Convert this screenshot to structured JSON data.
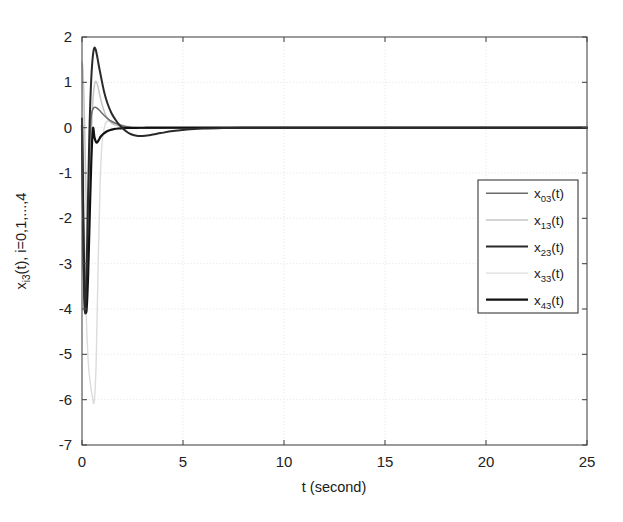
{
  "chart_data": {
    "type": "line",
    "title": "",
    "xlabel": "t (second)",
    "ylabel": "x_i3(t), i=0,1,...,4",
    "ylabel_parts": {
      "base": "x",
      "sub": "i3",
      "tail": "(t), i=0,1,...,4"
    },
    "xlim": [
      0,
      25
    ],
    "ylim": [
      -7,
      2
    ],
    "xticks": [
      0,
      5,
      10,
      15,
      20,
      25
    ],
    "xticklabels": [
      "0",
      "5",
      "10",
      "15",
      "20",
      "25"
    ],
    "yticks": [
      2,
      1,
      0,
      -1,
      -2,
      -3,
      -4,
      -5,
      -6,
      -7
    ],
    "yticklabels": [
      "2",
      "1",
      "0",
      "-1",
      "-2",
      "-3",
      "-4",
      "-5",
      "-6",
      "-7"
    ],
    "grid": true,
    "grid_color": "#d8d8d8",
    "legend_position": "center-right",
    "background": "#ffffff",
    "axis_color": "#4a4a4a",
    "series": [
      {
        "name": "x_03(t)",
        "label_base": "x",
        "label_sub": "03",
        "label_tail": "(t)",
        "color": "#6b6b6b",
        "width": 1.5,
        "x": [
          0,
          0.04,
          0.08,
          0.12,
          0.18,
          0.24,
          0.3,
          0.38,
          0.46,
          0.55,
          0.65,
          0.75,
          0.85,
          0.95,
          1.1,
          1.3,
          1.5,
          1.7,
          1.9,
          2.2,
          2.5,
          2.9,
          3.3,
          3.8,
          4.3,
          5.0,
          5.8,
          6.6,
          7.5,
          8.5,
          10.0,
          12.0,
          15.0,
          18.0,
          21.0,
          25.0
        ],
        "y": [
          0.15,
          -1.6,
          -3.2,
          -3.95,
          -4.05,
          -3.2,
          -1.9,
          -0.45,
          0.25,
          0.42,
          0.45,
          0.43,
          0.39,
          0.34,
          0.27,
          0.19,
          0.13,
          0.09,
          0.055,
          0.02,
          0.0,
          -0.01,
          -0.015,
          -0.012,
          -0.008,
          -0.004,
          -0.002,
          -0.001,
          0.0,
          0.0,
          0.0,
          0.0,
          0.0,
          0.0,
          0.0,
          0.0
        ]
      },
      {
        "name": "x_13(t)",
        "label_base": "x",
        "label_sub": "13",
        "label_tail": "(t)",
        "color": "#c4c4c4",
        "width": 1.5,
        "x": [
          0,
          0.04,
          0.1,
          0.16,
          0.22,
          0.3,
          0.38,
          0.46,
          0.54,
          0.62,
          0.7,
          0.78,
          0.88,
          1.0,
          1.15,
          1.3,
          1.5,
          1.7,
          1.95,
          2.2,
          2.5,
          2.9,
          3.3,
          3.8,
          4.3,
          5.0,
          5.8,
          6.6,
          7.5,
          8.5,
          10.0,
          12.0,
          15.0,
          18.0,
          21.0,
          25.0
        ],
        "y": [
          1.45,
          1.3,
          0.6,
          -0.6,
          -1.9,
          -2.5,
          -1.6,
          -0.2,
          0.6,
          0.95,
          1.02,
          0.92,
          0.72,
          0.5,
          0.3,
          0.18,
          0.09,
          0.05,
          0.02,
          0.01,
          0.0,
          -0.005,
          -0.008,
          -0.006,
          -0.004,
          -0.002,
          -0.001,
          0.0,
          0.0,
          0.0,
          0.0,
          0.0,
          0.0,
          0.0,
          0.0,
          0.0
        ]
      },
      {
        "name": "x_23(t)",
        "label_base": "x",
        "label_sub": "23",
        "label_tail": "(t)",
        "color": "#2a2a2a",
        "width": 2.0,
        "x": [
          0,
          0.04,
          0.08,
          0.14,
          0.2,
          0.28,
          0.36,
          0.44,
          0.52,
          0.6,
          0.68,
          0.76,
          0.84,
          0.95,
          1.1,
          1.25,
          1.45,
          1.65,
          1.85,
          2.1,
          2.4,
          2.7,
          3.0,
          3.4,
          3.9,
          4.5,
          5.2,
          6.0,
          7.0,
          8.0,
          9.5,
          11.5,
          14.0,
          17.0,
          21.0,
          25.0
        ],
        "y": [
          0.2,
          -1.5,
          -3.0,
          -4.05,
          -3.6,
          -2.0,
          -0.2,
          0.9,
          1.5,
          1.75,
          1.72,
          1.55,
          1.35,
          1.1,
          0.78,
          0.55,
          0.33,
          0.18,
          0.06,
          -0.05,
          -0.14,
          -0.18,
          -0.185,
          -0.16,
          -0.12,
          -0.075,
          -0.04,
          -0.02,
          -0.008,
          -0.003,
          0.0,
          0.0,
          0.0,
          0.0,
          0.0,
          0.0
        ]
      },
      {
        "name": "x_33(t)",
        "label_base": "x",
        "label_sub": "33",
        "label_tail": "(t)",
        "color": "#dcdcdc",
        "width": 1.4,
        "x": [
          0,
          0.05,
          0.12,
          0.2,
          0.3,
          0.4,
          0.5,
          0.6,
          0.7,
          0.8,
          0.9,
          1.0,
          1.15,
          1.3,
          1.5,
          1.7,
          1.95,
          2.2,
          2.5,
          2.9,
          3.3,
          3.8,
          4.4,
          5.0,
          5.8,
          6.6,
          7.5,
          8.5,
          10.0,
          12.0,
          14.0,
          17.0,
          20.0,
          22.0,
          24.0,
          25.0
        ],
        "y": [
          1.4,
          0.3,
          -2.1,
          -4.0,
          -5.1,
          -5.6,
          -5.9,
          -6.05,
          -5.2,
          -3.0,
          -1.2,
          -0.3,
          0.08,
          0.15,
          0.14,
          0.1,
          0.06,
          0.035,
          0.018,
          0.006,
          0.0,
          -0.003,
          -0.004,
          -0.003,
          -0.002,
          -0.001,
          0.0,
          0.0,
          0.0,
          0.0,
          0.0,
          0.0,
          0.0,
          0.0,
          0.0,
          0.0
        ]
      },
      {
        "name": "x_43(t)",
        "label_base": "x",
        "label_sub": "43",
        "label_tail": "(t)",
        "color": "#111111",
        "width": 2.2,
        "x": [
          0,
          0.04,
          0.09,
          0.15,
          0.22,
          0.3,
          0.38,
          0.46,
          0.54,
          0.62,
          0.72,
          0.82,
          0.92,
          1.05,
          1.2,
          1.4,
          1.6,
          1.8,
          2.05,
          2.3,
          2.6,
          2.9,
          3.2,
          3.6,
          4.1,
          4.7,
          5.4,
          6.2,
          7.2,
          8.2,
          9.5,
          11.5,
          14.0,
          17.0,
          21.0,
          25.0
        ],
        "y": [
          0.05,
          -1.4,
          -2.9,
          -3.85,
          -4.05,
          -3.3,
          -2.0,
          -0.75,
          -0.02,
          -0.22,
          -0.33,
          -0.28,
          -0.2,
          -0.14,
          -0.09,
          -0.05,
          -0.03,
          -0.018,
          -0.01,
          -0.006,
          -0.004,
          -0.002,
          -0.001,
          0.0,
          0.0,
          0.0,
          0.0,
          0.0,
          0.0,
          0.0,
          0.0,
          0.0,
          0.0,
          0.0,
          0.0,
          0.0
        ]
      }
    ]
  }
}
